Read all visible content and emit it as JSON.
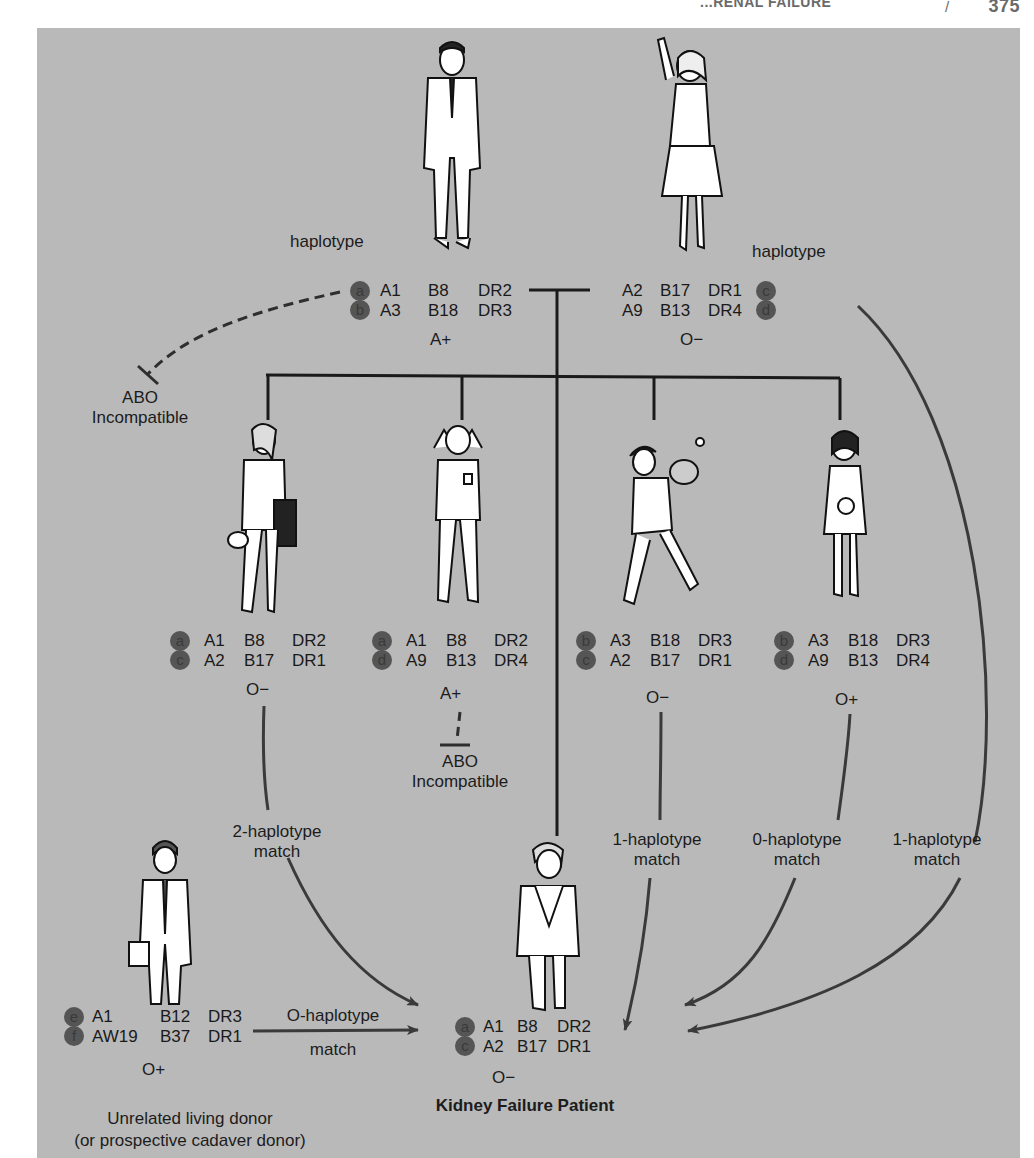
{
  "running_head": {
    "title": "...RENAL FAILURE",
    "separator": "/",
    "page_number": "375"
  },
  "colors": {
    "panel_background": "#b9b9b9",
    "badge_fill": "#555555",
    "line": "#1a1a1a",
    "arrow": "#3a3a3a"
  },
  "labels": {
    "haplotype_left": "haplotype",
    "haplotype_right": "haplotype",
    "abo_incompatible_parent": [
      "ABO",
      "Incompatible"
    ],
    "abo_incompatible_child": [
      "ABO",
      "Incompatible"
    ],
    "match_child1": [
      "2-haplotype",
      "match"
    ],
    "match_child3": [
      "1-haplotype",
      "match"
    ],
    "match_child4": [
      "0-haplotype",
      "match"
    ],
    "match_mother": [
      "1-haplotype",
      "match"
    ],
    "match_unrelated": [
      "O-haplotype",
      "match"
    ],
    "patient_caption": "Kidney Failure Patient",
    "unrelated_caption": [
      "Unrelated living donor",
      "(or prospective cadaver donor)"
    ]
  },
  "people": {
    "father": {
      "figure": "man-in-suit",
      "haplotypes": [
        {
          "id": "a",
          "A": "A1",
          "B": "B8",
          "DR": "DR2"
        },
        {
          "id": "b",
          "A": "A3",
          "B": "B18",
          "DR": "DR3"
        }
      ],
      "blood_type": "A+"
    },
    "mother": {
      "figure": "woman-waving",
      "haplotypes": [
        {
          "id": "c",
          "A": "A2",
          "B": "B17",
          "DR": "DR1"
        },
        {
          "id": "d",
          "A": "A9",
          "B": "B13",
          "DR": "DR4"
        }
      ],
      "blood_type": "O−"
    },
    "children": [
      {
        "figure": "woman-with-portfolio",
        "haplotypes": [
          {
            "id": "a",
            "A": "A1",
            "B": "B8",
            "DR": "DR2"
          },
          {
            "id": "c",
            "A": "A2",
            "B": "B17",
            "DR": "DR1"
          }
        ],
        "blood_type": "O−"
      },
      {
        "figure": "boy-stretching",
        "haplotypes": [
          {
            "id": "a",
            "A": "A1",
            "B": "B8",
            "DR": "DR2"
          },
          {
            "id": "d",
            "A": "A9",
            "B": "B13",
            "DR": "DR4"
          }
        ],
        "blood_type": "A+"
      },
      {
        "figure": "boy-baseball",
        "haplotypes": [
          {
            "id": "b",
            "A": "A3",
            "B": "B18",
            "DR": "DR3"
          },
          {
            "id": "c",
            "A": "A2",
            "B": "B17",
            "DR": "DR1"
          }
        ],
        "blood_type": "O−"
      },
      {
        "figure": "girl-with-doll",
        "haplotypes": [
          {
            "id": "b",
            "A": "A3",
            "B": "B18",
            "DR": "DR3"
          },
          {
            "id": "d",
            "A": "A9",
            "B": "B13",
            "DR": "DR4"
          }
        ],
        "blood_type": "O+"
      }
    ],
    "patient": {
      "figure": "boy-in-jacket",
      "haplotypes": [
        {
          "id": "a",
          "A": "A1",
          "B": "B8",
          "DR": "DR2"
        },
        {
          "id": "c",
          "A": "A2",
          "B": "B17",
          "DR": "DR1"
        }
      ],
      "blood_type": "O−"
    },
    "unrelated": {
      "figure": "man-with-briefcase",
      "haplotypes": [
        {
          "id": "e",
          "A": "A1",
          "B": "B12",
          "DR": "DR3"
        },
        {
          "id": "f",
          "A": "AW19",
          "B": "B37",
          "DR": "DR1"
        }
      ],
      "blood_type": "O+"
    }
  }
}
